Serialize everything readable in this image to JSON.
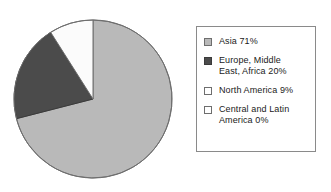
{
  "chart_data": {
    "type": "pie",
    "title": "",
    "subtitle": "",
    "xlabel": "",
    "ylabel": "",
    "grid": false,
    "legend_position": "right",
    "start_angle_deg": 0,
    "direction": "clockwise",
    "center": {
      "x": 80,
      "y": 81
    },
    "radius": 79,
    "categories": [
      "Asia",
      "Europe, Middle East, Africa",
      "North America",
      "Central and Latin America"
    ],
    "values": [
      71,
      20,
      9,
      0
    ],
    "units": "%",
    "colors": [
      "#b9b9b9",
      "#4b4b4b",
      "#fbfbfb",
      "#ffffff"
    ],
    "slices": [
      {
        "name": "asia",
        "label": "Asia 71%",
        "category": "Asia",
        "value": 71,
        "fill": "#b9b9b9",
        "stroke": "#6e6e6e",
        "start_deg": 0,
        "sweep_deg": 255.6
      },
      {
        "name": "europe-middle-east-africa",
        "label": "Europe, Middle East, Africa 20%",
        "category": "Europe, Middle East, Africa",
        "value": 20,
        "fill": "#4b4b4b",
        "stroke": "#3a3a3a",
        "start_deg": 255.6,
        "sweep_deg": 72
      },
      {
        "name": "north-america",
        "label": "North America 9%",
        "category": "North America",
        "value": 9,
        "fill": "#fbfbfb",
        "stroke": "#6e6e6e",
        "start_deg": 327.6,
        "sweep_deg": 32.4
      },
      {
        "name": "central-and-latin-america",
        "label": "Central and Latin America 0%",
        "category": "Central and Latin America",
        "value": 0,
        "fill": "#ffffff",
        "stroke": "#6e6e6e",
        "start_deg": 360,
        "sweep_deg": 0
      }
    ]
  },
  "legend": {
    "border_color": "#8a8a8a",
    "background": "#ffffff",
    "items": [
      {
        "label": "Asia 71%",
        "swatch_fill": "#b9b9b9",
        "swatch_border": "#6e6e6e"
      },
      {
        "label": "Europe, Middle\nEast, Africa 20%",
        "swatch_fill": "#4b4b4b",
        "swatch_border": "#3a3a3a"
      },
      {
        "label": "North America 9%",
        "swatch_fill": "#ffffff",
        "swatch_border": "#6e6e6e"
      },
      {
        "label": "Central and Latin\nAmerica 0%",
        "swatch_fill": "#ffffff",
        "swatch_border": "#6e6e6e"
      }
    ]
  }
}
